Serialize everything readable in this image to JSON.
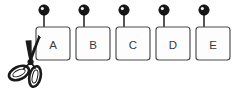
{
  "illustration": {
    "title": "Scissors cutting a row of hanging tags",
    "background_color": "#ffffff",
    "ink_color": "#1a1a1a",
    "card_stroke_color": "#4a4a4a",
    "card_fill_color": "#fdfdfd",
    "label_color": "#3a3a3a",
    "width": 239,
    "height": 97
  },
  "cards": [
    {
      "label": "A",
      "name": "card-a",
      "x": 36,
      "y": 27,
      "width": 34,
      "height": 33,
      "corner_radius": 3,
      "bead_cx": 44,
      "bead_cy": 10,
      "bead_r": 5.2,
      "stem_x": 44,
      "stem_top": 15,
      "stem_bottom": 33,
      "being_cut": true
    },
    {
      "label": "B",
      "name": "card-b",
      "x": 76,
      "y": 27,
      "width": 34,
      "height": 33,
      "corner_radius": 3,
      "bead_cx": 84,
      "bead_cy": 10,
      "bead_r": 5.2,
      "stem_x": 84,
      "stem_top": 15,
      "stem_bottom": 33,
      "being_cut": false
    },
    {
      "label": "C",
      "name": "card-c",
      "x": 116,
      "y": 27,
      "width": 34,
      "height": 33,
      "corner_radius": 3,
      "bead_cx": 124,
      "bead_cy": 10,
      "bead_r": 5.2,
      "stem_x": 124,
      "stem_top": 15,
      "stem_bottom": 33,
      "being_cut": false
    },
    {
      "label": "D",
      "name": "card-d",
      "x": 156,
      "y": 27,
      "width": 34,
      "height": 33,
      "corner_radius": 3,
      "bead_cx": 164,
      "bead_cy": 10,
      "bead_r": 5.2,
      "stem_x": 164,
      "stem_top": 15,
      "stem_bottom": 33,
      "being_cut": false
    },
    {
      "label": "E",
      "name": "card-e",
      "x": 196,
      "y": 27,
      "width": 34,
      "height": 33,
      "corner_radius": 3,
      "bead_cx": 204,
      "bead_cy": 10,
      "bead_r": 5.2,
      "stem_x": 204,
      "stem_top": 15,
      "stem_bottom": 33,
      "being_cut": false
    }
  ],
  "scissors": {
    "name": "scissors",
    "position": "lower-left",
    "orientation": "blades-up-right",
    "pivot_x": 30,
    "pivot_y": 62,
    "blade_tip_x": 38,
    "blade_tip_y": 36,
    "handle_loops": 2
  }
}
